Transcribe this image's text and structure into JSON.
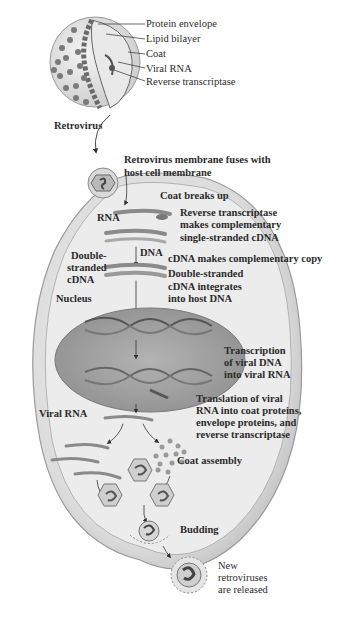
{
  "figure": {
    "type": "diagram",
    "caption_partial": "Figure 13.x (cut off)"
  },
  "virus_parts": {
    "protein_envelope": "Protein envelope",
    "lipid_bilayer": "Lipid bilayer",
    "coat": "Coat",
    "viral_rna": "Viral RNA",
    "reverse_transcriptase": "Reverse transcriptase"
  },
  "labels": {
    "retrovirus": "Retrovirus",
    "fuses_1": "Retrovirus membrane fuses with",
    "fuses_2": "host cell membrane",
    "coat_breaks": "Coat breaks up",
    "rna": "RNA",
    "rt_1": "Reverse transcriptase",
    "rt_2": "makes complementary",
    "rt_3": "single-stranded cDNA",
    "dna": "DNA",
    "cdna_copy": "cDNA makes complementary copy",
    "ds_1": "Double-",
    "ds_2": "stranded",
    "ds_3": "cDNA",
    "integ_1": "Double-stranded",
    "integ_2": "cDNA integrates",
    "integ_3": "into host DNA",
    "nucleus": "Nucleus",
    "tx_1": "Transcription",
    "tx_2": "of viral DNA",
    "tx_3": "into viral RNA",
    "tl_1": "Translation of viral",
    "tl_2": "RNA into coat proteins,",
    "tl_3": "envelope proteins, and",
    "tl_4": "reverse transcriptase",
    "viral_rna": "Viral RNA",
    "coat_assembly": "Coat assembly",
    "budding": "Budding",
    "new_1": "New",
    "new_2": "retroviruses",
    "new_3": "are released"
  },
  "colors": {
    "cell_fill": "#c9c9c9",
    "cell_inner": "#e6e6e6",
    "nucleus": "#9e9e9e",
    "strand": "#8a8a8a",
    "text": "#2b2b2b"
  }
}
